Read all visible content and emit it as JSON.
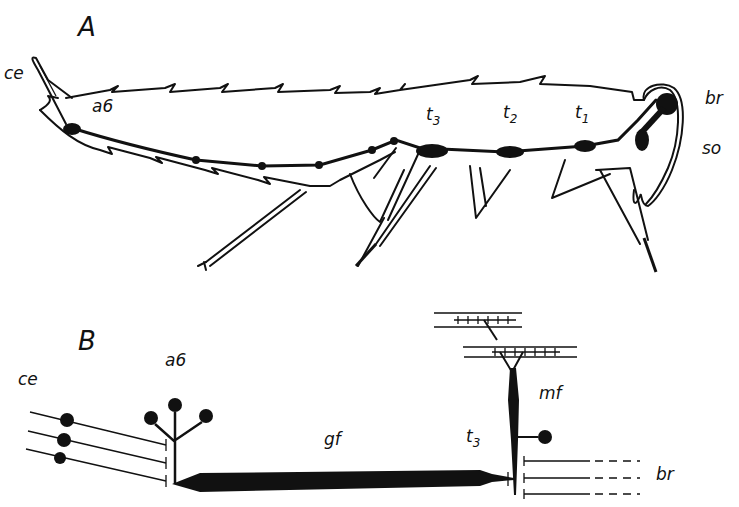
{
  "figure": {
    "panels": [
      {
        "id": "A",
        "label": "A",
        "description": "Lateral view of cricket showing ventral nerve cord",
        "labels": {
          "cerci": "ce",
          "abdominal_ganglion": "a6",
          "thoracic_3": "t",
          "thoracic_3_sub": "3",
          "thoracic_2": "t",
          "thoracic_2_sub": "2",
          "thoracic_1": "t",
          "thoracic_1_sub": "1",
          "brain": "br",
          "subesophageal": "so"
        }
      },
      {
        "id": "B",
        "label": "B",
        "description": "Schematic of giant fiber pathway",
        "labels": {
          "cerci": "ce",
          "abdominal_ganglion": "a6",
          "giant_fiber": "gf",
          "thoracic_3": "t",
          "thoracic_3_sub": "3",
          "motor_fiber": "mf",
          "brain": "br"
        }
      }
    ]
  }
}
